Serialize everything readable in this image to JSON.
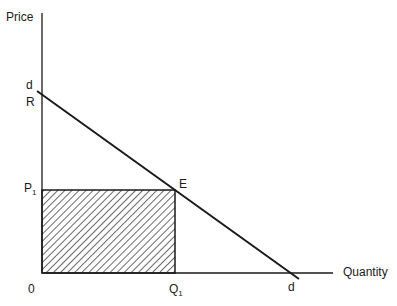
{
  "diagram": {
    "type": "economics-demand-revenue",
    "axes": {
      "y_label": "Price",
      "x_label": "Quantity",
      "origin_label": "0"
    },
    "demand_curve": {
      "label_top": "d",
      "label_bottom": "d"
    },
    "points": {
      "R": "R",
      "E": "E",
      "P1": "P",
      "P1_sub": "1",
      "Q1": "Q",
      "Q1_sub": "1"
    },
    "shaded_region": "total-revenue-rectangle"
  }
}
